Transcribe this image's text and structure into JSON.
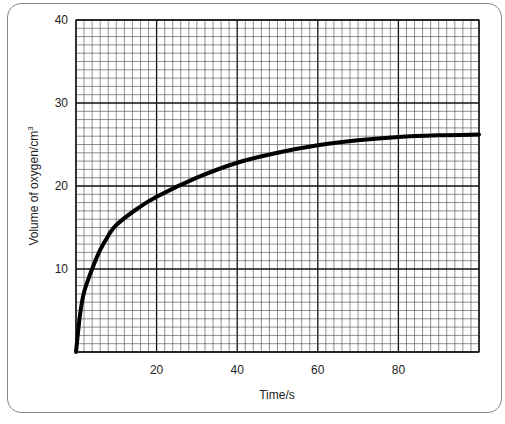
{
  "chart_data": {
    "type": "line",
    "title": "",
    "xlabel": "Time/s",
    "ylabel": "Volume of oxygen/cm³",
    "xlim": [
      0,
      100
    ],
    "ylim": [
      0,
      40
    ],
    "grid": true,
    "x_ticks": [
      20,
      40,
      60,
      80
    ],
    "y_ticks": [
      10,
      20,
      30,
      40
    ],
    "series": [
      {
        "name": "oxygen volume",
        "x": [
          0,
          1,
          2,
          4,
          6,
          8,
          10,
          15,
          20,
          30,
          40,
          50,
          60,
          70,
          80,
          90,
          100
        ],
        "y": [
          0,
          4.5,
          7.2,
          10,
          12.3,
          14,
          15.3,
          17.2,
          18.7,
          21,
          22.8,
          24,
          24.9,
          25.5,
          25.9,
          26.1,
          26.2
        ]
      }
    ]
  },
  "labels": {
    "xlabel": "Time/s",
    "ylabel_main": "Volume of oxygen/cm",
    "ylabel_sup": "3"
  }
}
